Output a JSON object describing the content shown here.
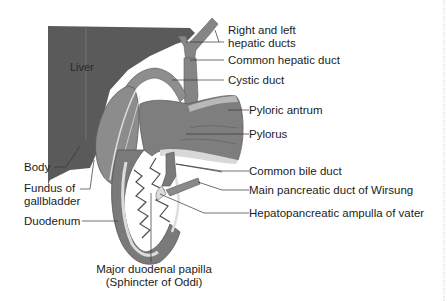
{
  "figure": {
    "organ_labels": {
      "liver": "Liver"
    },
    "labels": {
      "right_left_hepatic_line1": "Right and left",
      "right_left_hepatic_line2": "hepatic ducts",
      "common_hepatic_duct": "Common hepatic duct",
      "cystic_duct": "Cystic duct",
      "pyloric_antrum": "Pyloric antrum",
      "pylorus": "Pylorus",
      "common_bile_duct": "Common bile duct",
      "main_pancreatic_duct": "Main pancreatic duct of Wirsung",
      "hepatopancreatic_ampulla": "Hepatopancreatic ampulla of vater",
      "body": "Body",
      "fundus_line1": "Fundus of",
      "fundus_line2": "gallbladder",
      "duodenum": "Duodenum",
      "papilla_line1": "Major duodenal papilla",
      "papilla_line2": "(Sphincter of Oddi)"
    },
    "colors": {
      "liver": "#5a5a5a",
      "organ": "#8a8a8a",
      "organ_dark": "#6e6e6e",
      "lumen_light": "#d6d6d6",
      "leader_line": "#333333"
    }
  }
}
